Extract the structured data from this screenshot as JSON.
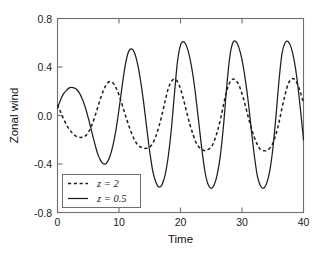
{
  "chart_data": {
    "type": "line",
    "title": "",
    "xlabel": "Time",
    "ylabel": "Zonal wind",
    "xlim": [
      0,
      40
    ],
    "ylim": [
      -0.8,
      0.8
    ],
    "xticks": [
      0,
      10,
      20,
      30,
      40
    ],
    "xtick_labels": [
      "0",
      "10",
      "20",
      "30",
      "40"
    ],
    "yticks": [
      0.8,
      0.4,
      0.0,
      -0.4,
      -0.8
    ],
    "ytick_labels": [
      "0.8",
      "0.4",
      "0.0",
      "-0.4",
      "-0.8"
    ],
    "grid": false,
    "legend_position": "lower left",
    "series": [
      {
        "name": "z = 2",
        "style": "dashed",
        "color": "#1e1e1e",
        "x": [
          0,
          0.5,
          1,
          1.5,
          2,
          2.5,
          3,
          3.5,
          4,
          4.5,
          5,
          5.5,
          6,
          6.5,
          7,
          7.5,
          8,
          8.5,
          9,
          9.5,
          10,
          10.5,
          11,
          11.5,
          12,
          12.5,
          13,
          13.5,
          14,
          14.5,
          15,
          15.5,
          16,
          16.5,
          17,
          17.5,
          18,
          18.5,
          19,
          19.5,
          20,
          20.5,
          21,
          21.5,
          22,
          22.5,
          23,
          23.5,
          24,
          24.5,
          25,
          25.5,
          26,
          26.5,
          27,
          27.5,
          28,
          28.5,
          29,
          29.5,
          30,
          30.5,
          31,
          31.5,
          32,
          32.5,
          33,
          33.5,
          34,
          34.5,
          35,
          35.5,
          36,
          36.5,
          37,
          37.5,
          38,
          38.5,
          39,
          39.5,
          40
        ],
        "y": [
          0.09,
          0.03,
          -0.03,
          -0.08,
          -0.12,
          -0.15,
          -0.17,
          -0.18,
          -0.18,
          -0.17,
          -0.14,
          -0.09,
          -0.02,
          0.06,
          0.14,
          0.21,
          0.26,
          0.28,
          0.27,
          0.23,
          0.17,
          0.09,
          0.01,
          -0.07,
          -0.14,
          -0.2,
          -0.24,
          -0.26,
          -0.27,
          -0.27,
          -0.26,
          -0.23,
          -0.17,
          -0.09,
          0.01,
          0.12,
          0.22,
          0.28,
          0.3,
          0.28,
          0.22,
          0.13,
          0.03,
          -0.07,
          -0.15,
          -0.22,
          -0.26,
          -0.28,
          -0.29,
          -0.28,
          -0.26,
          -0.21,
          -0.13,
          -0.03,
          0.09,
          0.2,
          0.27,
          0.3,
          0.29,
          0.25,
          0.18,
          0.09,
          -0.01,
          -0.1,
          -0.18,
          -0.24,
          -0.28,
          -0.29,
          -0.29,
          -0.27,
          -0.23,
          -0.16,
          -0.06,
          0.06,
          0.17,
          0.26,
          0.3,
          0.3,
          0.26,
          0.19,
          0.1
        ]
      },
      {
        "name": "z = 0.5",
        "style": "solid",
        "color": "#1e1e1e",
        "x": [
          0,
          0.5,
          1,
          1.5,
          2,
          2.5,
          3,
          3.5,
          4,
          4.5,
          5,
          5.5,
          6,
          6.5,
          7,
          7.5,
          8,
          8.5,
          9,
          9.5,
          10,
          10.5,
          11,
          11.5,
          12,
          12.5,
          13,
          13.5,
          14,
          14.5,
          15,
          15.5,
          16,
          16.5,
          17,
          17.5,
          18,
          18.5,
          19,
          19.5,
          20,
          20.5,
          21,
          21.5,
          22,
          22.5,
          23,
          23.5,
          24,
          24.5,
          25,
          25.5,
          26,
          26.5,
          27,
          27.5,
          28,
          28.5,
          29,
          29.5,
          30,
          30.5,
          31,
          31.5,
          32,
          32.5,
          33,
          33.5,
          34,
          34.5,
          35,
          35.5,
          36,
          36.5,
          37,
          37.5,
          38,
          38.5,
          39,
          39.5,
          40
        ],
        "y": [
          0.06,
          0.13,
          0.18,
          0.21,
          0.23,
          0.23,
          0.22,
          0.19,
          0.14,
          0.07,
          -0.02,
          -0.12,
          -0.22,
          -0.31,
          -0.37,
          -0.4,
          -0.39,
          -0.34,
          -0.25,
          -0.12,
          0.05,
          0.24,
          0.41,
          0.52,
          0.55,
          0.52,
          0.43,
          0.29,
          0.11,
          -0.1,
          -0.3,
          -0.46,
          -0.55,
          -0.59,
          -0.57,
          -0.49,
          -0.34,
          -0.12,
          0.17,
          0.44,
          0.58,
          0.61,
          0.57,
          0.48,
          0.34,
          0.15,
          -0.07,
          -0.29,
          -0.47,
          -0.57,
          -0.6,
          -0.57,
          -0.48,
          -0.32,
          -0.08,
          0.23,
          0.48,
          0.6,
          0.61,
          0.56,
          0.46,
          0.31,
          0.12,
          -0.11,
          -0.33,
          -0.5,
          -0.58,
          -0.6,
          -0.56,
          -0.46,
          -0.28,
          -0.02,
          0.28,
          0.51,
          0.6,
          0.61,
          0.56,
          0.45,
          0.28,
          0.05,
          -0.2
        ]
      }
    ]
  }
}
